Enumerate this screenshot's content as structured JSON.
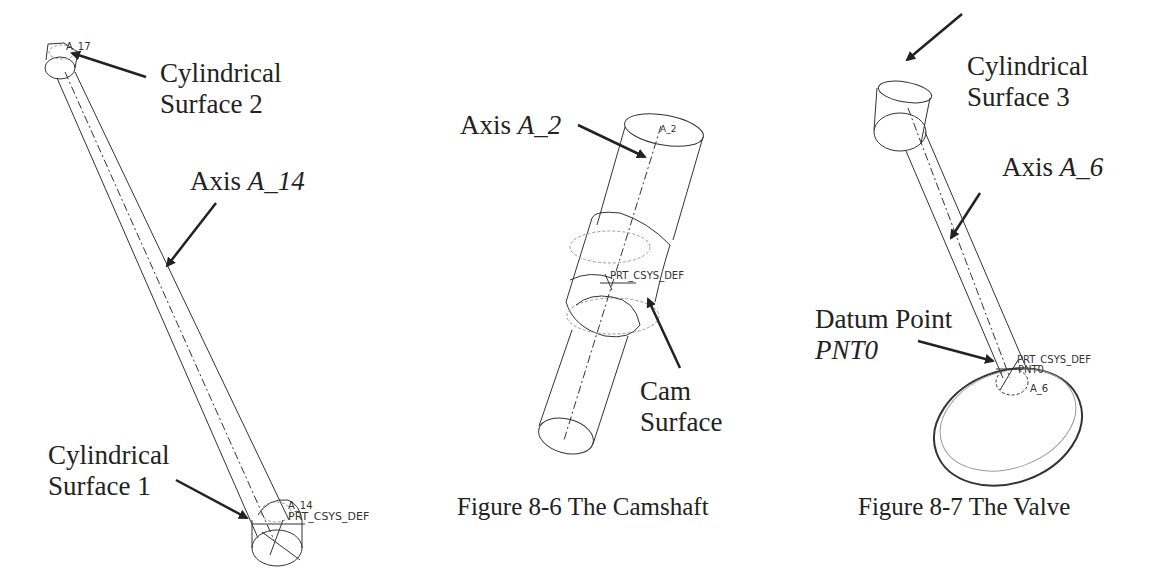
{
  "figures": [
    {
      "id": "pushrod",
      "caption": "",
      "labels": {
        "cyl_surface_2_line1": "Cylindrical",
        "cyl_surface_2_line2": "Surface 2",
        "axis_prefix": "Axis ",
        "axis_name": "A_14",
        "cyl_surface_1_line1": "Cylindrical",
        "cyl_surface_1_line2": "Surface 1"
      },
      "cad_tags": {
        "top_axis": "A_17",
        "bottom_axis": "A_14",
        "csys": "PRT_CSYS_DEF"
      }
    },
    {
      "id": "camshaft",
      "caption": "Figure 8-6  The Camshaft",
      "labels": {
        "axis_prefix": "Axis ",
        "axis_name": "A_2",
        "cam_line1": "Cam",
        "cam_line2": "Surface"
      },
      "cad_tags": {
        "axis": "A_2",
        "csys": "PRT_CSYS_DEF"
      }
    },
    {
      "id": "valve",
      "caption": "Figure 8-7  The Valve",
      "labels": {
        "cyl_surface_3_line1": "Cylindrical",
        "cyl_surface_3_line2": "Surface 3",
        "axis_prefix": "Axis ",
        "axis_name": "A_6",
        "datum_line1": "Datum Point",
        "datum_line2": "PNT0"
      },
      "cad_tags": {
        "top_axis": "A_6",
        "csys": "PRT_CSYS_DEF",
        "point": "PNT0",
        "bottom_axis": "A_6"
      }
    }
  ],
  "colors": {
    "ink": "#222222",
    "line": "#333333",
    "hidden_line": "#9a9a9a",
    "background": "#ffffff"
  }
}
